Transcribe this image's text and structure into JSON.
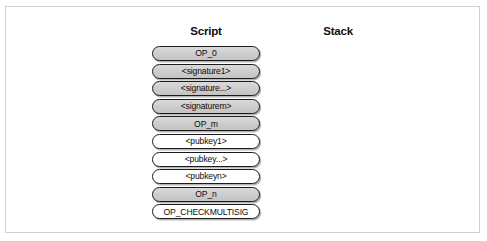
{
  "figure": {
    "columns": {
      "script_header": "Script",
      "stack_header": "Stack"
    },
    "script_items": [
      {
        "label": "OP_0",
        "fill": "gray"
      },
      {
        "label": "<signature1>",
        "fill": "gray"
      },
      {
        "label": "<signature...>",
        "fill": "gray"
      },
      {
        "label": "<signaturem>",
        "fill": "gray"
      },
      {
        "label": "OP_m",
        "fill": "gray"
      },
      {
        "label": "<pubkey1>",
        "fill": "white"
      },
      {
        "label": "<pubkey...>",
        "fill": "white"
      },
      {
        "label": "<pubkeyn>",
        "fill": "white"
      },
      {
        "label": "OP_n",
        "fill": "gray"
      },
      {
        "label": "OP_CHECKMULTISIG",
        "fill": "white"
      }
    ],
    "stack_items": [],
    "colors": {
      "box_fill_gray": "#cfcfcf",
      "box_fill_white": "#ffffff",
      "box_border": "#1b1b1b",
      "frame_border": "#d2d2d2",
      "background": "#ffffff",
      "text": "#0c0c0c"
    }
  }
}
